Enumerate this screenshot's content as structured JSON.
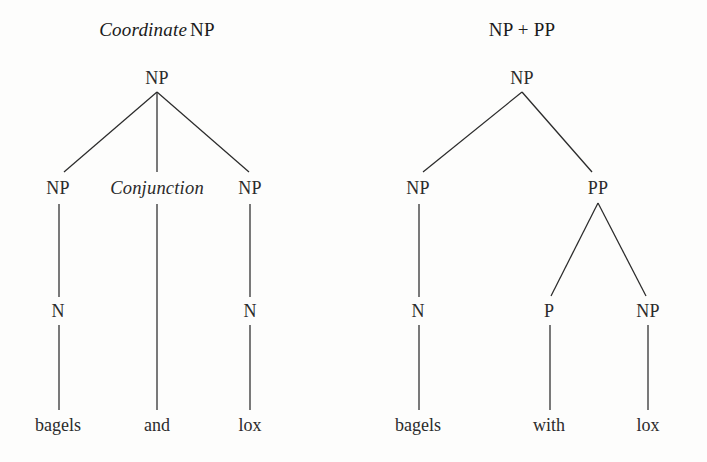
{
  "figure": {
    "background_color": "#fdfdfc",
    "ink_color": "#2b2b2b",
    "width": 707,
    "height": 462,
    "caption": ""
  },
  "panels": [
    {
      "id": "coordinate-np",
      "title_italic": "Coordinate",
      "title_roman": "NP",
      "title_text": "Coordinate NP",
      "title_x": 157,
      "title_y": 30,
      "nodes": [
        {
          "id": "l-root",
          "label": "NP",
          "x": 157,
          "y": 78,
          "style": "roman"
        },
        {
          "id": "l-np1",
          "label": "NP",
          "x": 58,
          "y": 188,
          "style": "roman"
        },
        {
          "id": "l-conj",
          "label": "Conjunction",
          "x": 157,
          "y": 188,
          "style": "italic"
        },
        {
          "id": "l-np2",
          "label": "NP",
          "x": 250,
          "y": 188,
          "style": "roman"
        },
        {
          "id": "l-n1",
          "label": "N",
          "x": 58,
          "y": 311,
          "style": "roman"
        },
        {
          "id": "l-n2",
          "label": "N",
          "x": 250,
          "y": 311,
          "style": "roman"
        }
      ],
      "leaves": [
        {
          "id": "l-leaf1",
          "label": "bagels",
          "x": 58,
          "y": 425
        },
        {
          "id": "l-leaf2",
          "label": "and",
          "x": 157,
          "y": 425
        },
        {
          "id": "l-leaf3",
          "label": "lox",
          "x": 250,
          "y": 425
        }
      ],
      "edges": [
        {
          "from": "l-root",
          "to": "l-np1",
          "x1": 157,
          "y1": 92,
          "x2": 64,
          "y2": 172
        },
        {
          "from": "l-root",
          "to": "l-conj",
          "x1": 157,
          "y1": 92,
          "x2": 157,
          "y2": 172
        },
        {
          "from": "l-root",
          "to": "l-np2",
          "x1": 157,
          "y1": 92,
          "x2": 249,
          "y2": 172
        },
        {
          "from": "l-np1",
          "to": "l-n1",
          "x1": 59,
          "y1": 204,
          "x2": 59,
          "y2": 297
        },
        {
          "from": "l-conj",
          "to": "l-leaf2",
          "x1": 157,
          "y1": 204,
          "x2": 157,
          "y2": 410
        },
        {
          "from": "l-np2",
          "to": "l-n2",
          "x1": 250,
          "y1": 204,
          "x2": 250,
          "y2": 297
        },
        {
          "from": "l-n1",
          "to": "l-leaf1",
          "x1": 59,
          "y1": 325,
          "x2": 59,
          "y2": 410
        },
        {
          "from": "l-n2",
          "to": "l-leaf3",
          "x1": 250,
          "y1": 325,
          "x2": 250,
          "y2": 410
        }
      ]
    },
    {
      "id": "np-plus-pp",
      "title_italic": "",
      "title_roman": "NP + PP",
      "title_text": "NP + PP",
      "title_x": 522,
      "title_y": 30,
      "nodes": [
        {
          "id": "r-root",
          "label": "NP",
          "x": 522,
          "y": 78,
          "style": "roman"
        },
        {
          "id": "r-np1",
          "label": "NP",
          "x": 418,
          "y": 188,
          "style": "roman"
        },
        {
          "id": "r-pp",
          "label": "PP",
          "x": 598,
          "y": 188,
          "style": "roman"
        },
        {
          "id": "r-n1",
          "label": "N",
          "x": 418,
          "y": 311,
          "style": "roman"
        },
        {
          "id": "r-p",
          "label": "P",
          "x": 549,
          "y": 311,
          "style": "roman"
        },
        {
          "id": "r-np2",
          "label": "NP",
          "x": 648,
          "y": 311,
          "style": "roman"
        }
      ],
      "leaves": [
        {
          "id": "r-leaf1",
          "label": "bagels",
          "x": 418,
          "y": 425
        },
        {
          "id": "r-leaf2",
          "label": "with",
          "x": 549,
          "y": 425
        },
        {
          "id": "r-leaf3",
          "label": "lox",
          "x": 648,
          "y": 425
        }
      ],
      "edges": [
        {
          "from": "r-root",
          "to": "r-np1",
          "x1": 522,
          "y1": 92,
          "x2": 423,
          "y2": 172
        },
        {
          "from": "r-root",
          "to": "r-pp",
          "x1": 522,
          "y1": 92,
          "x2": 592,
          "y2": 172
        },
        {
          "from": "r-np1",
          "to": "r-n1",
          "x1": 419,
          "y1": 204,
          "x2": 419,
          "y2": 297
        },
        {
          "from": "r-pp",
          "to": "r-p",
          "x1": 598,
          "y1": 203,
          "x2": 551,
          "y2": 296
        },
        {
          "from": "r-pp",
          "to": "r-np2",
          "x1": 598,
          "y1": 203,
          "x2": 646,
          "y2": 296
        },
        {
          "from": "r-n1",
          "to": "r-leaf1",
          "x1": 419,
          "y1": 325,
          "x2": 419,
          "y2": 410
        },
        {
          "from": "r-p",
          "to": "r-leaf2",
          "x1": 550,
          "y1": 325,
          "x2": 550,
          "y2": 410
        },
        {
          "from": "r-np2",
          "to": "r-leaf3",
          "x1": 648,
          "y1": 325,
          "x2": 648,
          "y2": 410
        }
      ]
    }
  ]
}
